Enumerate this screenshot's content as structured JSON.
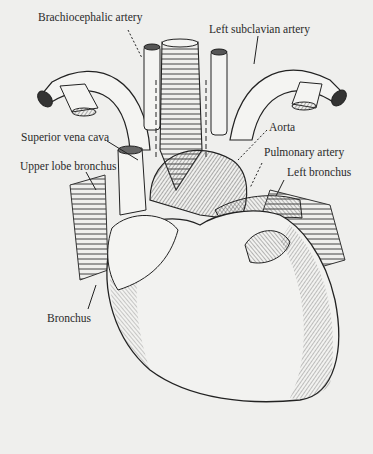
{
  "figure": {
    "labels": [
      {
        "id": "brachiocephalic",
        "text": "Brachiocephalic artery",
        "x": 38,
        "y": 19
      },
      {
        "id": "left-subclavian",
        "text": "Left subclavian artery",
        "x": 209,
        "y": 25
      },
      {
        "id": "superior-vena-cava",
        "text": "Superior vena cava",
        "x": 21,
        "y": 135
      },
      {
        "id": "upper-lobe-bronchus",
        "text": "Upper lobe bronchus",
        "x": 20,
        "y": 164
      },
      {
        "id": "aorta",
        "text": "Aorta",
        "x": 269,
        "y": 125
      },
      {
        "id": "pulmonary-artery",
        "text": "Pulmonary artery",
        "x": 264,
        "y": 150
      },
      {
        "id": "left-bronchus",
        "text": "Left bronchus",
        "x": 287,
        "y": 169
      },
      {
        "id": "bronchus",
        "text": "Bronchus",
        "x": 47,
        "y": 317
      }
    ]
  },
  "colors": {
    "background": "#efefed",
    "ink": "#2a2a2a",
    "shade": "#8a8a8a"
  }
}
